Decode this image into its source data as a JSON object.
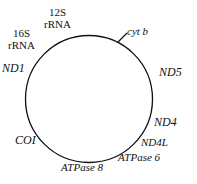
{
  "figure": {
    "type": "circular-genome-map",
    "title": "",
    "background_color": "#ffffff",
    "stroke_color": "#111111",
    "circle": {
      "center_x": 89,
      "center_y": 99,
      "radius": 63.5,
      "stroke_width": 1.3
    },
    "tick_marks": [
      {
        "name": "cyt-b-tick",
        "x1": 118,
        "y1": 42,
        "x2": 127,
        "y2": 33
      }
    ]
  },
  "labels": {
    "rrna_12s": {
      "line1": "12S",
      "line2": "rRNA",
      "style": "roman",
      "x": 44,
      "y": 7,
      "font_size": 11
    },
    "rrna_16s": {
      "line1": "16S",
      "line2": "rRNA",
      "style": "roman",
      "x": 8,
      "y": 28,
      "font_size": 11
    },
    "nd1": {
      "text": "ND1",
      "style": "italic",
      "x": 2,
      "y": 62,
      "font_size": 12
    },
    "cyt_b": {
      "text": "cyt b",
      "style": "italic",
      "x": 127,
      "y": 26,
      "font_size": 11
    },
    "nd5": {
      "text": "ND5",
      "style": "italic",
      "x": 159,
      "y": 66,
      "font_size": 12
    },
    "nd4": {
      "text": "ND4",
      "style": "italic",
      "x": 154,
      "y": 116,
      "font_size": 12
    },
    "nd4l": {
      "text": "ND4L",
      "style": "italic",
      "x": 141,
      "y": 137,
      "font_size": 11
    },
    "atpase_6": {
      "text": "ATPase 6",
      "style": "italic",
      "x": 118,
      "y": 152,
      "font_size": 11
    },
    "atpase_8": {
      "text": "ATPase 8",
      "style": "italic",
      "x": 61,
      "y": 162,
      "font_size": 11
    },
    "coi": {
      "text": "COI",
      "style": "italic",
      "x": 15,
      "y": 134,
      "font_size": 12
    }
  }
}
